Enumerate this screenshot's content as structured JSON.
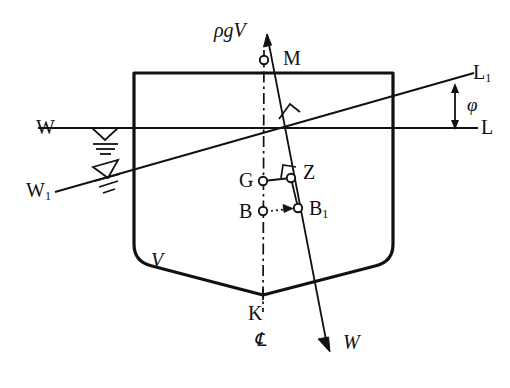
{
  "figure": {
    "type": "engineering-line-diagram",
    "background_color": "#ffffff",
    "line_color": "#111111"
  },
  "labels": {
    "buoyancy_force": "ρgV",
    "metacenter": "M",
    "waterline_upright_port": "W",
    "waterline_upright_stbd": "L",
    "waterline_heeled_port": "W",
    "waterline_heeled_port_sub": "1",
    "waterline_heeled_stbd": "L",
    "waterline_heeled_stbd_sub": "1",
    "heel_angle": "φ",
    "center_of_gravity": "G",
    "righting_arm_point": "Z",
    "center_of_buoyancy": "B",
    "center_of_buoyancy_heeled": "B",
    "center_of_buoyancy_heeled_sub": "1",
    "displaced_volume": "V",
    "keel": "K",
    "centerline": "℄",
    "weight_force": "W"
  },
  "geometry": {
    "hull": {
      "top_left": [
        134,
        73
      ],
      "top_right": [
        393,
        73
      ],
      "bilge_left": [
        134,
        262
      ],
      "bilge_right": [
        393,
        262
      ],
      "keel_point": [
        263,
        300
      ],
      "corner_radius": 18
    },
    "waterline_upright": {
      "x1": 38,
      "y1": 128,
      "x2": 478,
      "y2": 128
    },
    "waterline_heeled": {
      "x1": 55,
      "y1": 192,
      "x2": 474,
      "y2": 73
    },
    "centerline": {
      "x1": 264,
      "y1": 50,
      "x2": 263,
      "y2": 312
    },
    "buoyancy_axis": {
      "x1": 268,
      "y1": 28,
      "x2": 330,
      "y2": 350
    },
    "points": {
      "M": [
        264,
        60
      ],
      "G": [
        263,
        181
      ],
      "Z": [
        291,
        178
      ],
      "B": [
        263,
        211
      ],
      "B1": [
        298,
        208
      ]
    },
    "angle_arrow": {
      "x": 455,
      "y_top": 85,
      "y_bottom": 128
    }
  },
  "style_values": {
    "marker_radius": 4,
    "hull_stroke_width": 3,
    "line_stroke_width": 1.8,
    "centerline_dash": "10 4 2 4"
  }
}
